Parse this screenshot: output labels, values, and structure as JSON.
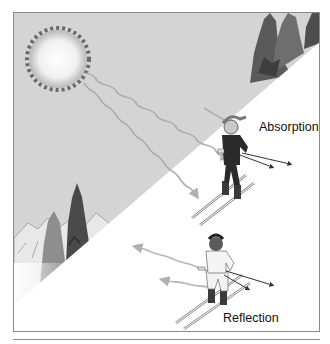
{
  "diagram": {
    "labels": {
      "absorption": "Absorption",
      "reflection": "Reflection"
    },
    "elements": {
      "sun": "sun-icon",
      "trees": "evergreen-trees",
      "mountains": "snowy-mountains",
      "skier_top": "skier-dark-clothing",
      "skier_bottom": "skier-light-clothing",
      "incoming_rays": "wavy-arrows-incoming",
      "reflected_rays": "wavy-arrows-reflected"
    },
    "colors": {
      "sky": "#d4d4d4",
      "snow": "#ffffff",
      "sun_core": "#fafafa",
      "sun_edge": "#6a6a6a",
      "tree_dark": "#4a4a4a",
      "tree_mid": "#7a7a7a",
      "ray": "#b0b0b0",
      "border": "#8a8a8a"
    }
  }
}
